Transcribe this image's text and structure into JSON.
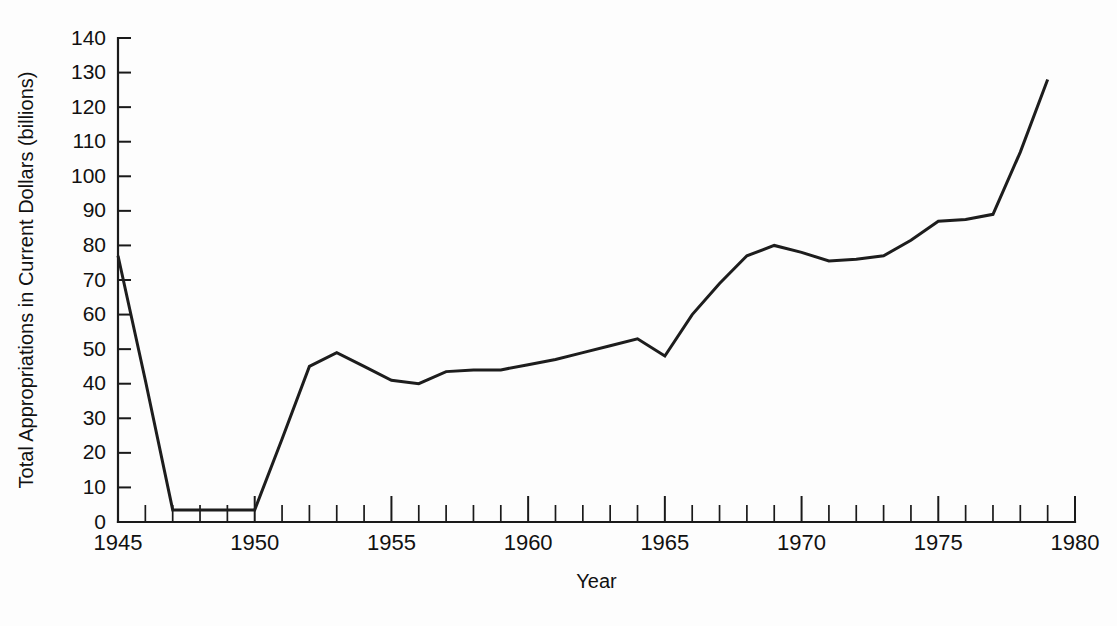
{
  "chart_data": {
    "type": "line",
    "title": "",
    "xlabel": "Year",
    "ylabel": "Total Appropriations in Current Dollars (billions)",
    "xlim": [
      1945,
      1980
    ],
    "ylim": [
      0,
      140
    ],
    "ytick_step": 10,
    "xtick_major_step": 5,
    "xtick_minor_step": 1,
    "grid": false,
    "legend": false,
    "yticks": [
      0,
      10,
      20,
      30,
      40,
      50,
      60,
      70,
      80,
      90,
      100,
      110,
      120,
      130,
      140
    ],
    "xticks_major": [
      1945,
      1950,
      1955,
      1960,
      1965,
      1970,
      1975,
      1980
    ],
    "line_color": "#1d1d1d",
    "axis_color": "#1a1a1a",
    "background_color": "#fdfdfd",
    "x": [
      1945,
      1946,
      1947,
      1948,
      1949,
      1950,
      1951,
      1952,
      1953,
      1954,
      1955,
      1956,
      1957,
      1958,
      1959,
      1960,
      1961,
      1962,
      1963,
      1964,
      1965,
      1966,
      1967,
      1968,
      1969,
      1970,
      1971,
      1972,
      1973,
      1974,
      1975,
      1976,
      1977,
      1978,
      1979
    ],
    "values": [
      77,
      41,
      3.5,
      3.5,
      3.5,
      3.5,
      24,
      45,
      49,
      45,
      41,
      40,
      43.5,
      44,
      44,
      45.5,
      47,
      49,
      51,
      53,
      48,
      60,
      69,
      77,
      80,
      78,
      75.5,
      76,
      77,
      81.5,
      87,
      87.5,
      89,
      107,
      128
    ],
    "series": [
      {
        "name": "Total Appropriations",
        "values": [
          77,
          41,
          3.5,
          3.5,
          3.5,
          3.5,
          24,
          45,
          49,
          45,
          41,
          40,
          43.5,
          44,
          44,
          45.5,
          47,
          49,
          51,
          53,
          48,
          60,
          69,
          77,
          80,
          78,
          75.5,
          76,
          77,
          81.5,
          87,
          87.5,
          89,
          107,
          128
        ]
      }
    ]
  }
}
